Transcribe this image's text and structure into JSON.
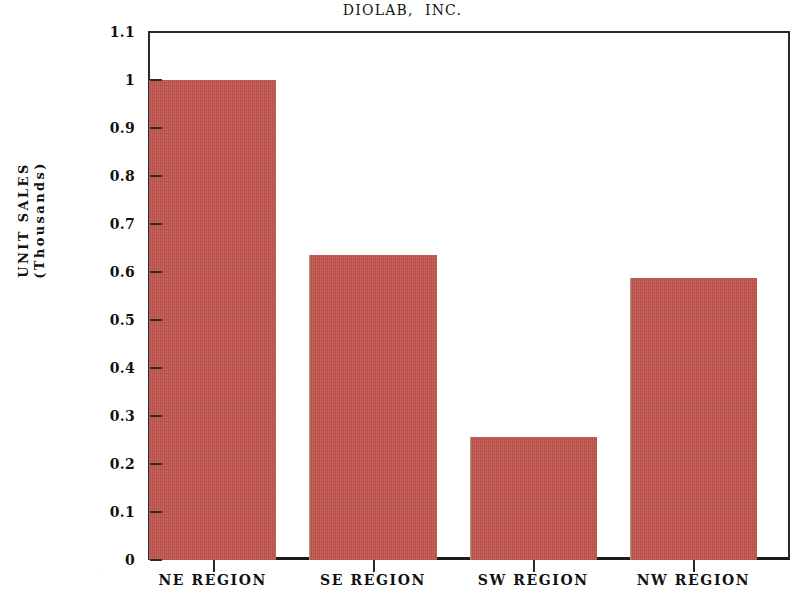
{
  "chart_data": {
    "type": "bar",
    "title": "DIOLAB,  INC.",
    "xlabel": "",
    "ylabel_lines": [
      "UNIT SALES",
      "(Thousands)"
    ],
    "ylabel": "UNIT SALES (Thousands)",
    "categories": [
      "NE REGION",
      "SE REGION",
      "SW REGION",
      "NW REGION"
    ],
    "values": [
      1.0,
      0.635,
      0.257,
      0.588
    ],
    "ylim": [
      0,
      1.1
    ],
    "ytick_values": [
      0,
      0.1,
      0.2,
      0.3,
      0.4,
      0.5,
      0.6,
      0.7,
      0.8,
      0.9,
      1.0,
      1.1
    ],
    "ytick_labels": [
      "0",
      "0.1",
      "0.2",
      "0.3",
      "0.4",
      "0.5",
      "0.6",
      "0.7",
      "0.8",
      "0.9",
      "1",
      "1.1"
    ],
    "grid": false,
    "legend": false,
    "legend_position": "none",
    "bar_color": "#c0534a",
    "axis_color": "#2b2b2b",
    "background_color": "#ffffff"
  }
}
